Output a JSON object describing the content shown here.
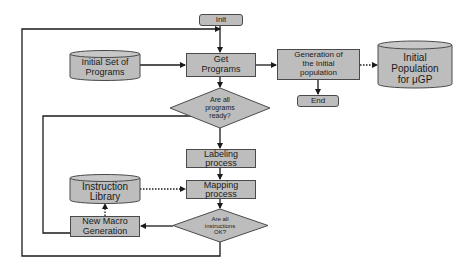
{
  "diagram": {
    "type": "flowchart",
    "nodes": {
      "init": {
        "label": "Init",
        "shape": "rounded-rect"
      },
      "initial_set": {
        "label": "Initial Set of Programs",
        "line1": "Initial Set of",
        "line2": "Programs",
        "shape": "cylinder"
      },
      "get_programs": {
        "label": "Get Programs",
        "line1": "Get",
        "line2": "Programs",
        "shape": "rect"
      },
      "programs_ready": {
        "label": "Are all programs ready?",
        "line1": "Are all",
        "line2": "programs",
        "line3": "ready?",
        "shape": "diamond"
      },
      "generation": {
        "label": "Generation of the Initial population",
        "line1": "Generation of",
        "line2": "the Initial",
        "line3": "population",
        "shape": "rect"
      },
      "initial_population": {
        "label": "Initial Population for μGP",
        "line1": "Initial",
        "line2": "Population",
        "line3": "for μGP",
        "shape": "cylinder"
      },
      "end": {
        "label": "End",
        "shape": "rounded-rect"
      },
      "labeling": {
        "label": "Labeling process",
        "line1": "Labeling",
        "line2": "process",
        "shape": "rect"
      },
      "mapping": {
        "label": "Mapping process",
        "line1": "Mapping",
        "line2": "process",
        "shape": "rect"
      },
      "instruction_library": {
        "label": "Instruction Library",
        "line1": "Instruction",
        "line2": "Library",
        "shape": "cylinder"
      },
      "instructions_ok": {
        "label": "Are all instructions OK?",
        "line1": "Are all",
        "line2": "instructions",
        "line3": "OK?",
        "shape": "diamond"
      },
      "new_macro": {
        "label": "New Macro Generation",
        "line1": "New Macro",
        "line2": "Generation",
        "shape": "rect"
      }
    },
    "edges": [
      {
        "from": "init",
        "to": "get_programs",
        "style": "solid"
      },
      {
        "from": "initial_set",
        "to": "get_programs",
        "style": "solid"
      },
      {
        "from": "get_programs",
        "to": "programs_ready",
        "style": "solid"
      },
      {
        "from": "get_programs",
        "to": "generation",
        "style": "solid"
      },
      {
        "from": "generation",
        "to": "initial_population",
        "style": "dotted"
      },
      {
        "from": "generation",
        "to": "end",
        "style": "solid"
      },
      {
        "from": "programs_ready",
        "to": "labeling",
        "style": "solid"
      },
      {
        "from": "labeling",
        "to": "mapping",
        "style": "solid"
      },
      {
        "from": "instruction_library",
        "to": "mapping",
        "style": "dotted"
      },
      {
        "from": "mapping",
        "to": "instructions_ok",
        "style": "solid"
      },
      {
        "from": "instructions_ok",
        "to": "new_macro",
        "style": "solid"
      },
      {
        "from": "new_macro",
        "to": "instruction_library",
        "style": "dotted"
      },
      {
        "from": "new_macro",
        "to": "labeling",
        "style": "solid",
        "note": "inner loop back above Labeling"
      },
      {
        "from": "instructions_ok",
        "to": "get_programs",
        "style": "solid",
        "note": "outer loop back above Get Programs"
      }
    ],
    "colors": {
      "fill": "#bdbdbd",
      "stroke": "#2a2a2a",
      "background": "#ffffff"
    }
  }
}
